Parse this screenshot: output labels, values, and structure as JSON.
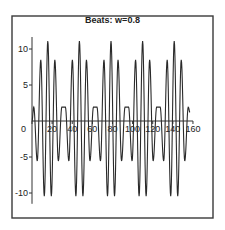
{
  "chart_data": {
    "type": "line",
    "title": "Beats: w=0.8",
    "xlabel": "",
    "ylabel": "",
    "xlim": [
      0,
      160
    ],
    "ylim": [
      -11.5,
      12.5
    ],
    "grid": false,
    "legend": null,
    "x_ticks": [
      0,
      20,
      40,
      60,
      80,
      100,
      120,
      140,
      160
    ],
    "x_tick_labels": [
      "0",
      "20",
      "40",
      "60",
      "80",
      "100",
      "120",
      "140",
      "160"
    ],
    "y_ticks": [
      10,
      5,
      -5,
      -10
    ],
    "y_tick_labels": [
      "10",
      "5",
      "-5",
      "-10"
    ],
    "series": [
      {
        "name": "x(t)",
        "description": "beats oscillation, extrema points (t, value)",
        "start": [
          0,
          0
        ],
        "end": [
          157,
          1.2
        ],
        "extrema": [
          [
            1.75,
            1.93
          ],
          [
            5.24,
            -5.56
          ],
          [
            8.73,
            8.51
          ],
          [
            12.22,
            -10.44
          ],
          [
            15.71,
            11.11
          ],
          [
            19.2,
            -10.44
          ],
          [
            22.69,
            8.51
          ],
          [
            26.18,
            -5.56
          ],
          [
            29.67,
            1.93
          ],
          [
            33.16,
            1.93
          ],
          [
            36.65,
            -5.56
          ],
          [
            40.14,
            8.51
          ],
          [
            43.63,
            -10.44
          ],
          [
            47.12,
            11.11
          ],
          [
            50.62,
            -10.44
          ],
          [
            54.11,
            8.51
          ],
          [
            57.6,
            -5.56
          ],
          [
            61.09,
            1.93
          ],
          [
            64.58,
            1.93
          ],
          [
            68.07,
            -5.56
          ],
          [
            71.56,
            8.51
          ],
          [
            75.05,
            -10.44
          ],
          [
            78.54,
            11.11
          ],
          [
            82.03,
            -10.44
          ],
          [
            85.52,
            8.51
          ],
          [
            89.01,
            -5.56
          ],
          [
            92.5,
            1.93
          ],
          [
            95.99,
            1.93
          ],
          [
            99.48,
            -5.56
          ],
          [
            102.97,
            8.51
          ],
          [
            106.46,
            -10.44
          ],
          [
            109.96,
            11.11
          ],
          [
            113.45,
            -10.44
          ],
          [
            116.94,
            8.51
          ],
          [
            120.43,
            -5.56
          ],
          [
            123.92,
            1.93
          ],
          [
            127.41,
            1.93
          ],
          [
            130.9,
            -5.56
          ],
          [
            134.39,
            8.51
          ],
          [
            137.88,
            -10.44
          ],
          [
            141.37,
            11.11
          ],
          [
            144.86,
            -10.44
          ],
          [
            148.35,
            8.51
          ],
          [
            151.84,
            -5.56
          ],
          [
            155.33,
            1.93
          ]
        ]
      }
    ]
  },
  "plot_area": {
    "frame": {
      "x": 12,
      "y": 16,
      "w": 201,
      "h": 202
    },
    "origin_px": {
      "x": 32,
      "y": 121
    },
    "x_px_per_unit": 1.006,
    "y_px_per_unit": 7.2
  },
  "colors": {
    "line": "#2a2a2a",
    "frame": "#3a3a3a",
    "background": "#ffffff"
  }
}
